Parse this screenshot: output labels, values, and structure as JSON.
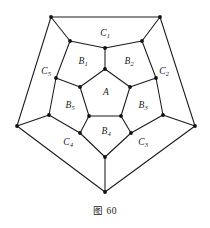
{
  "figure": {
    "caption": "图 60",
    "colors": {
      "ink": "#1a1a1a",
      "background": "#ffffff",
      "vertex": "#111111"
    },
    "outer_face_labels": [
      {
        "id": "C1",
        "letter": "C",
        "sub": "1",
        "x": 105,
        "y": 34
      },
      {
        "id": "C2",
        "letter": "C",
        "sub": "2",
        "x": 164,
        "y": 72
      },
      {
        "id": "C3",
        "letter": "C",
        "sub": "3",
        "x": 143,
        "y": 143
      },
      {
        "id": "C4",
        "letter": "C",
        "sub": "4",
        "x": 68,
        "y": 143
      },
      {
        "id": "C5",
        "letter": "C",
        "sub": "5",
        "x": 46,
        "y": 72
      }
    ],
    "middle_face_labels": [
      {
        "id": "B1",
        "letter": "B",
        "sub": "1",
        "x": 83,
        "y": 62
      },
      {
        "id": "B2",
        "letter": "B",
        "sub": "2",
        "x": 129,
        "y": 62
      },
      {
        "id": "B3",
        "letter": "B",
        "sub": "3",
        "x": 143,
        "y": 106
      },
      {
        "id": "B4",
        "letter": "B",
        "sub": "4",
        "x": 106,
        "y": 132
      },
      {
        "id": "B5",
        "letter": "B",
        "sub": "5",
        "x": 70,
        "y": 106
      }
    ],
    "center_face_label": {
      "id": "A",
      "letter": "A",
      "sub": "",
      "x": 106,
      "y": 93
    },
    "outer_vertices": [
      {
        "id": "O1",
        "x": 51,
        "y": 17
      },
      {
        "id": "O2",
        "x": 160,
        "y": 17
      },
      {
        "id": "O3",
        "x": 195,
        "y": 126
      },
      {
        "id": "O4",
        "x": 105,
        "y": 192
      },
      {
        "id": "O5",
        "x": 17,
        "y": 126
      }
    ],
    "ring_outer_vertices": [
      {
        "id": "R1",
        "x": 70,
        "y": 41
      },
      {
        "id": "R2",
        "x": 142,
        "y": 41
      },
      {
        "id": "R3",
        "x": 163,
        "y": 115
      },
      {
        "id": "R4",
        "x": 105,
        "y": 157
      },
      {
        "id": "R5",
        "x": 49,
        "y": 115
      }
    ],
    "ring_inner_vertices": [
      {
        "id": "S1",
        "x": 105,
        "y": 48
      },
      {
        "id": "S2",
        "x": 156,
        "y": 78
      },
      {
        "id": "S3",
        "x": 131,
        "y": 133
      },
      {
        "id": "S4",
        "x": 80,
        "y": 133
      },
      {
        "id": "S5",
        "x": 56,
        "y": 78
      }
    ],
    "inner_vertices": [
      {
        "id": "A1",
        "x": 105,
        "y": 69
      },
      {
        "id": "A2",
        "x": 130,
        "y": 87
      },
      {
        "id": "A3",
        "x": 121,
        "y": 116
      },
      {
        "id": "A4",
        "x": 89,
        "y": 116
      },
      {
        "id": "A5",
        "x": 80,
        "y": 87
      }
    ],
    "edges": [
      {
        "from": "O1",
        "to": "O2"
      },
      {
        "from": "O2",
        "to": "O3"
      },
      {
        "from": "O3",
        "to": "O4"
      },
      {
        "from": "O4",
        "to": "O5"
      },
      {
        "from": "O5",
        "to": "O1"
      },
      {
        "from": "O1",
        "to": "R1"
      },
      {
        "from": "O2",
        "to": "R2"
      },
      {
        "from": "O3",
        "to": "R3"
      },
      {
        "from": "O4",
        "to": "R4"
      },
      {
        "from": "O5",
        "to": "R5"
      },
      {
        "from": "R1",
        "to": "S1"
      },
      {
        "from": "S1",
        "to": "R2"
      },
      {
        "from": "R2",
        "to": "S2"
      },
      {
        "from": "S2",
        "to": "R3"
      },
      {
        "from": "R3",
        "to": "S3"
      },
      {
        "from": "S3",
        "to": "R4"
      },
      {
        "from": "R4",
        "to": "S4"
      },
      {
        "from": "S4",
        "to": "R5"
      },
      {
        "from": "R5",
        "to": "S5"
      },
      {
        "from": "S5",
        "to": "R1"
      },
      {
        "from": "S1",
        "to": "A1"
      },
      {
        "from": "S2",
        "to": "A2"
      },
      {
        "from": "S3",
        "to": "A3"
      },
      {
        "from": "S4",
        "to": "A4"
      },
      {
        "from": "S5",
        "to": "A5"
      },
      {
        "from": "A1",
        "to": "A2"
      },
      {
        "from": "A2",
        "to": "A3"
      },
      {
        "from": "A3",
        "to": "A4"
      },
      {
        "from": "A4",
        "to": "A5"
      },
      {
        "from": "A5",
        "to": "A1"
      }
    ]
  }
}
